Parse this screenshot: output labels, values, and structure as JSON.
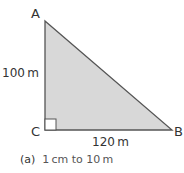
{
  "vertices": {
    "A": "A",
    "B": "B",
    "C": "C"
  },
  "sides": {
    "AC": "100 m",
    "CB": "120 m"
  },
  "caption": {
    "label": "(a)",
    "text": "1 cm to 10 m"
  },
  "colors": {
    "fill": "#d6d6d6",
    "stroke": "#555555"
  }
}
